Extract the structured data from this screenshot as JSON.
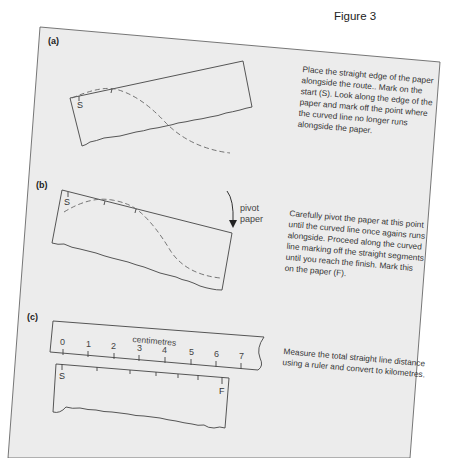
{
  "figure": {
    "title": "Figure 3",
    "colors": {
      "page_background": "#ececec",
      "outside_background": "#ffffff",
      "line": "#444444",
      "dashed_route": "#666666",
      "text": "#333333"
    }
  },
  "panels": [
    {
      "label": "(a)",
      "start_mark": "S",
      "description": "Place the straight edge of the paper\nalongside the route.. Mark on the\nstart (S).  Look along the edge of the\npaper and mark off the point where\nthe curved line no longer runs\nalongside the paper."
    },
    {
      "label": "(b)",
      "start_mark": "S",
      "pivot_label": "pivot\npaper",
      "description": "Carefully pivot the paper at this point\nuntil the curved line once agains runs\nalongside.  Proceed along the curved\nline marking off the straight segments\nuntil you reach the finish.  Mark this\non the paper (F)."
    },
    {
      "label": "(c)",
      "start_mark": "S",
      "finish_mark": "F",
      "ruler_units": "centimetres",
      "ruler_ticks": [
        "0",
        "1",
        "2",
        "3",
        "4",
        "5",
        "6",
        "7"
      ],
      "description": "Measure the total straight line distance\nusing a ruler and convert to kilometres."
    }
  ]
}
